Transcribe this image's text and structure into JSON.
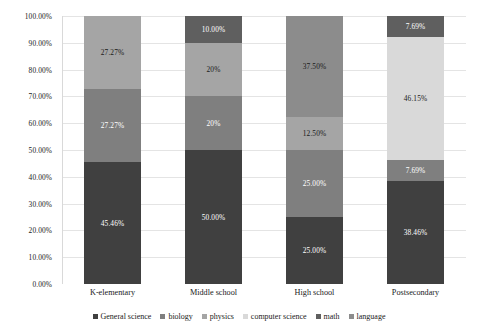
{
  "chart_data": {
    "type": "bar",
    "subtype": "stacked-100-percent",
    "title": "",
    "xlabel": "",
    "ylabel": "",
    "ylim": [
      0,
      100
    ],
    "grid": true,
    "legend_position": "bottom",
    "categories": [
      "K-elementary",
      "Middle school",
      "High school",
      "Postsecondary"
    ],
    "ytick_labels": [
      "0.00%",
      "10.00%",
      "20.00%",
      "30.00%",
      "40.00%",
      "50.00%",
      "60.00%",
      "70.00%",
      "80.00%",
      "90.00%",
      "100.00%"
    ],
    "ytick_values": [
      0,
      10,
      20,
      30,
      40,
      50,
      60,
      70,
      80,
      90,
      100
    ],
    "series": [
      {
        "name": "General science",
        "color": "#404040",
        "values": [
          45.46,
          50.0,
          25.0,
          38.46
        ],
        "labels": [
          "45.46%",
          "50.00%",
          "25.00%",
          "38.46%"
        ]
      },
      {
        "name": "biology",
        "color": "#7f7f7f",
        "values": [
          27.27,
          20.0,
          25.0,
          7.69
        ],
        "labels": [
          "27.27%",
          "20%",
          "25.00%",
          "7.69%"
        ]
      },
      {
        "name": "physics",
        "color": "#a5a5a5",
        "values": [
          27.27,
          20.0,
          12.5,
          0
        ],
        "labels": [
          "27.27%",
          "20%",
          "12.50%",
          ""
        ]
      },
      {
        "name": "computer science",
        "color": "#d9d9d9",
        "values": [
          0,
          0,
          0,
          46.15
        ],
        "labels": [
          "",
          "",
          "",
          "46.15%"
        ]
      },
      {
        "name": "math",
        "color": "#5f5f5f",
        "values": [
          0,
          10.0,
          0,
          7.69
        ],
        "labels": [
          "",
          "10.00%",
          "",
          "7.69%"
        ]
      },
      {
        "name": "language",
        "color": "#8c8c8c",
        "values": [
          0,
          0,
          37.5,
          0
        ],
        "labels": [
          "",
          "",
          "37.50%",
          ""
        ]
      }
    ]
  },
  "legend": {
    "items": [
      {
        "label": "General science",
        "color": "#404040"
      },
      {
        "label": "biology",
        "color": "#7f7f7f"
      },
      {
        "label": "physics",
        "color": "#a5a5a5"
      },
      {
        "label": "computer science",
        "color": "#d9d9d9"
      },
      {
        "label": "math",
        "color": "#5f5f5f"
      },
      {
        "label": "language",
        "color": "#8c8c8c"
      }
    ]
  }
}
